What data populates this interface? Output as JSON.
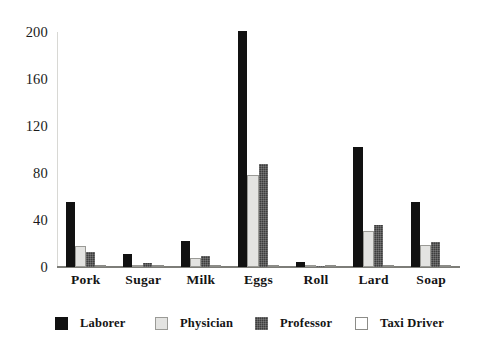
{
  "chart_data": {
    "type": "bar",
    "title": "",
    "subtitle": "",
    "xlabel": "",
    "ylabel": "",
    "categories": [
      "Pork",
      "Sugar",
      "Milk",
      "Eggs",
      "Roll",
      "Lard",
      "Soap"
    ],
    "series": [
      {
        "name": "Laborer",
        "color": "#111111",
        "values": [
          55,
          11,
          22,
          201,
          4,
          102,
          55
        ]
      },
      {
        "name": "Physician",
        "color": "#e3e3e1",
        "values": [
          18,
          2,
          8,
          78,
          1,
          31,
          19
        ]
      },
      {
        "name": "Professor",
        "color": "#3d3d3d",
        "values": [
          13,
          3,
          9,
          88,
          1,
          36,
          21
        ]
      },
      {
        "name": "Taxi Driver",
        "color": "#ffffff",
        "values": [
          1,
          1,
          1,
          1,
          1,
          1,
          1
        ]
      }
    ],
    "ylim": [
      0,
      200
    ],
    "yticks": [
      0,
      40,
      80,
      120,
      160,
      200
    ],
    "ytick_labels": [
      "0",
      "40",
      "80",
      "120",
      "160",
      "200"
    ],
    "grid": false,
    "legend_position": "bottom",
    "legend_entries": [
      "Laborer",
      "Physician",
      "Professor",
      "Taxi Driver"
    ]
  }
}
